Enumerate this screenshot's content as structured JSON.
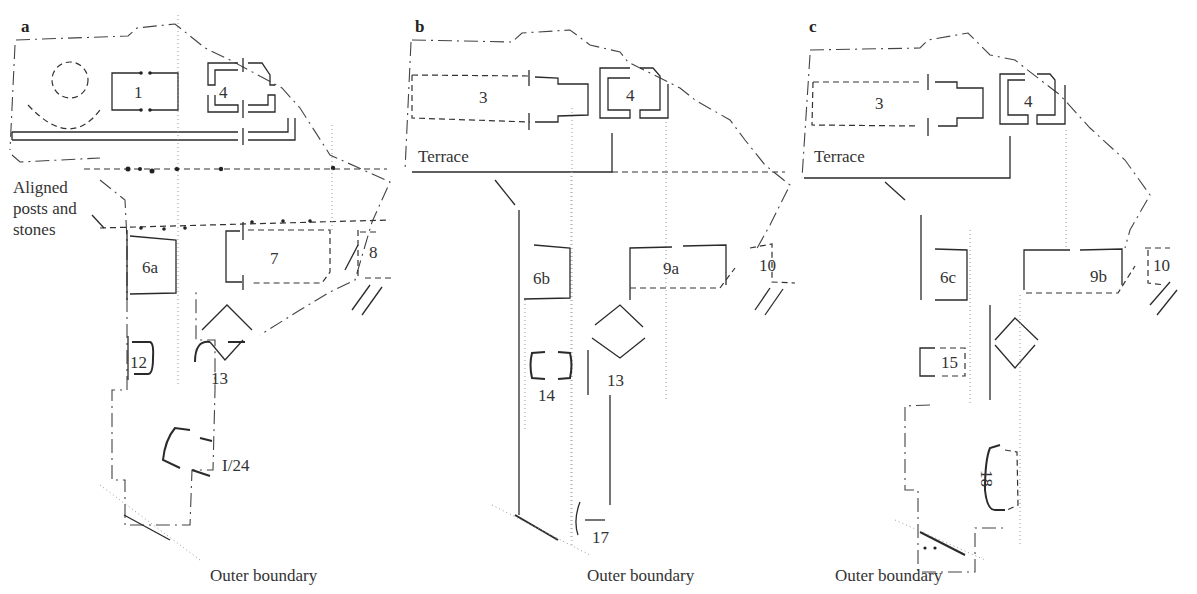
{
  "panels": [
    {
      "letter": "a",
      "labels": {
        "s1": "1",
        "s4": "4",
        "aligned": "Aligned\nposts and\nstones",
        "s6a": "6a",
        "s7": "7",
        "s8": "8",
        "s12": "12",
        "s13": "13",
        "s124": "I/24",
        "outer": "Outer boundary"
      }
    },
    {
      "letter": "b",
      "labels": {
        "s3": "3",
        "s4": "4",
        "terrace": "Terrace",
        "s6b": "6b",
        "s9a": "9a",
        "s10": "10",
        "s14": "14",
        "s13": "13",
        "s17": "17",
        "outer": "Outer boundary"
      }
    },
    {
      "letter": "c",
      "labels": {
        "s3": "3",
        "s4": "4",
        "terrace": "Terrace",
        "s6c": "6c",
        "s9b": "9b",
        "s10": "10",
        "s15": "15",
        "s18": "18",
        "outer": "Outer boundary"
      }
    }
  ]
}
